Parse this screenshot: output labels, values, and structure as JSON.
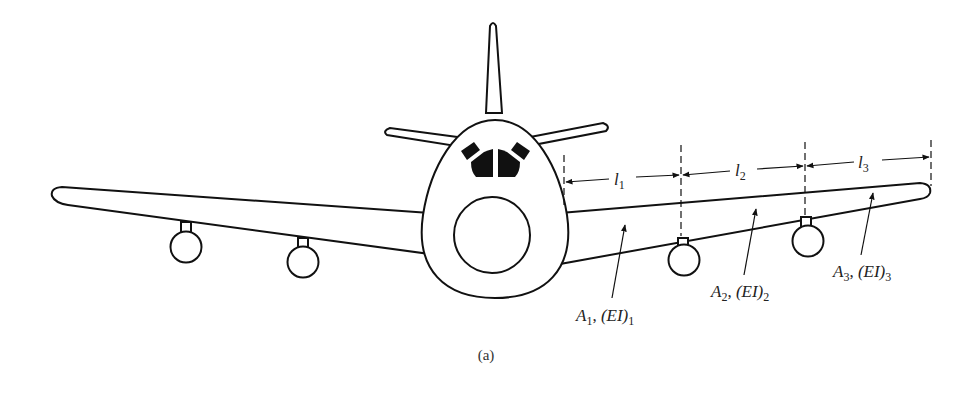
{
  "figure": {
    "caption": "(a)"
  },
  "dimensions": [
    {
      "symbol": "l",
      "subscript": "1"
    },
    {
      "symbol": "l",
      "subscript": "2"
    },
    {
      "symbol": "l",
      "subscript": "3"
    }
  ],
  "segments": [
    {
      "area": "A",
      "area_sub": "1",
      "sep": ", ",
      "stiffness": "(EI)",
      "stiffness_sub": "1"
    },
    {
      "area": "A",
      "area_sub": "2",
      "sep": ", ",
      "stiffness": "(EI)",
      "stiffness_sub": "2"
    },
    {
      "area": "A",
      "area_sub": "3",
      "sep": ", ",
      "stiffness": "(EI)",
      "stiffness_sub": "3"
    }
  ],
  "colors": {
    "line": "#111111",
    "background": "#ffffff"
  }
}
